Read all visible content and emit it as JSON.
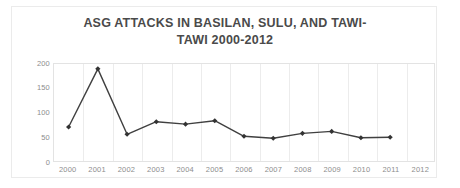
{
  "chart_data": {
    "type": "line",
    "title_line1": "ASG ATTACKS IN BASILAN, SULU, AND TAWI-",
    "title_line2": "TAWI 2000-2012",
    "xlabel": "",
    "ylabel": "",
    "categories": [
      "2000",
      "2001",
      "2002",
      "2003",
      "2004",
      "2005",
      "2006",
      "2007",
      "2008",
      "2009",
      "2010",
      "2011",
      "2012"
    ],
    "values": [
      70,
      190,
      55,
      81,
      76,
      83,
      51,
      47,
      57,
      61,
      48,
      49,
      null
    ],
    "series": [
      {
        "name": "ASG attacks",
        "values": [
          70,
          190,
          55,
          81,
          76,
          83,
          51,
          47,
          57,
          61,
          48,
          49,
          null
        ]
      }
    ],
    "ylim": [
      0,
      200
    ],
    "yticks": [
      0,
      50,
      100,
      150,
      200
    ],
    "ytick_labels": [
      "0",
      "50",
      "100",
      "150",
      "200"
    ],
    "grid": "vertical-only",
    "legend": "none",
    "marker": "diamond",
    "line_color": "#404040",
    "marker_color": "#333333",
    "title_color": "#4a4a4a",
    "tick_color": "#8d8d8d",
    "gridline_color": "#ececec",
    "plot_background": "#ffffff"
  }
}
